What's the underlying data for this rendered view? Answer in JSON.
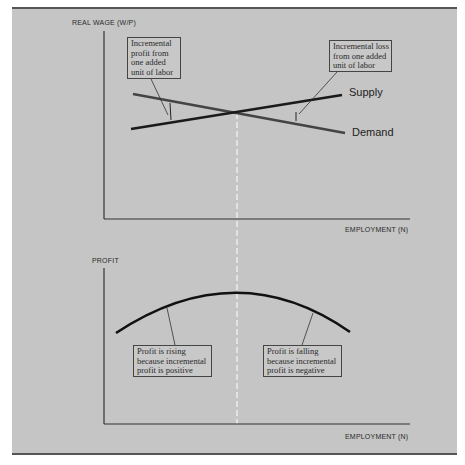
{
  "figure": {
    "top_chart": {
      "y_axis_label": "REAL WAGE (W/P)",
      "x_axis_label": "EMPLOYMENT (N)",
      "supply_label": "Supply",
      "demand_label": "Demand",
      "annotation_left": [
        "Incremental",
        "profit from",
        "one added",
        "unit of labor"
      ],
      "annotation_right": [
        "Incremental loss",
        "from one added",
        "unit of labor"
      ]
    },
    "bottom_chart": {
      "y_axis_label": "PROFIT",
      "x_axis_label": "EMPLOYMENT (N)",
      "annotation_left": [
        "Profit is rising",
        "because incremental",
        "profit is positive"
      ],
      "annotation_right": [
        "Profit is falling",
        "because incremental",
        "profit is negative"
      ]
    },
    "colors": {
      "background": "#c5c5c5",
      "supply_line": "#1a1a1a",
      "demand_line": "#444444",
      "profit_curve": "#111111",
      "divider": "#ffffff"
    }
  }
}
